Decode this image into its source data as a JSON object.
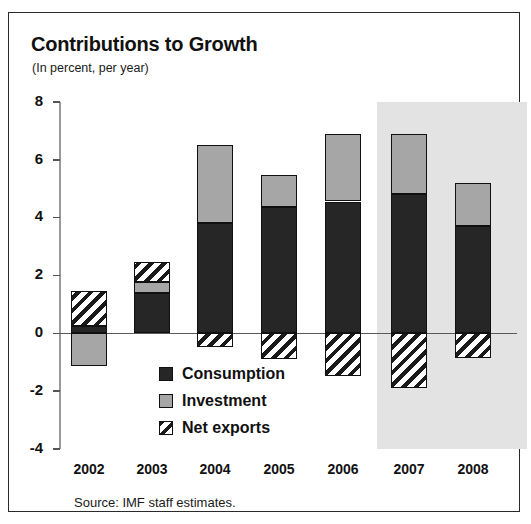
{
  "chart_data": {
    "type": "bar",
    "title": "Contributions to Growth",
    "subtitle": "(In percent, per year)",
    "xlabel": "",
    "ylabel": "",
    "ylim": [
      -4,
      8
    ],
    "yticks": [
      8,
      6,
      4,
      2,
      0,
      -2,
      -4
    ],
    "grid": false,
    "stacked": true,
    "legend_position": "inside-lower-center",
    "categories": [
      "2002",
      "2003",
      "2004",
      "2005",
      "2006",
      "2007",
      "2008"
    ],
    "series": [
      {
        "name": "Consumption",
        "color": "#262626",
        "values": [
          0.25,
          1.4,
          3.8,
          4.35,
          4.55,
          4.8,
          3.7
        ]
      },
      {
        "name": "Investment",
        "color": "#a6a6a6",
        "values": [
          -1.15,
          0.35,
          2.7,
          1.1,
          2.35,
          2.1,
          1.5
        ]
      },
      {
        "name": "Net exports",
        "color": "#ffffff",
        "hatch": "diagonal",
        "values": [
          1.2,
          0.7,
          -0.5,
          -0.9,
          -1.5,
          -1.9,
          -0.85
        ]
      }
    ],
    "segments": [
      {
        "category": "2002",
        "name": "Net exports",
        "from": 0.25,
        "to": 1.45
      },
      {
        "category": "2002",
        "name": "Consumption",
        "from": 0.0,
        "to": 0.25
      },
      {
        "category": "2002",
        "name": "Investment",
        "from": -1.15,
        "to": 0.0
      },
      {
        "category": "2003",
        "name": "Net exports",
        "from": 1.75,
        "to": 2.45
      },
      {
        "category": "2003",
        "name": "Investment",
        "from": 1.4,
        "to": 1.75
      },
      {
        "category": "2003",
        "name": "Consumption",
        "from": 0.0,
        "to": 1.4
      },
      {
        "category": "2004",
        "name": "Investment",
        "from": 3.8,
        "to": 6.5
      },
      {
        "category": "2004",
        "name": "Consumption",
        "from": 0.0,
        "to": 3.8
      },
      {
        "category": "2004",
        "name": "Net exports",
        "from": -0.5,
        "to": 0.0
      },
      {
        "category": "2005",
        "name": "Investment",
        "from": 4.35,
        "to": 5.45
      },
      {
        "category": "2005",
        "name": "Consumption",
        "from": 0.0,
        "to": 4.35
      },
      {
        "category": "2005",
        "name": "Net exports",
        "from": -0.9,
        "to": 0.0
      },
      {
        "category": "2006",
        "name": "Investment",
        "from": 4.55,
        "to": 6.9
      },
      {
        "category": "2006",
        "name": "Consumption",
        "from": 0.0,
        "to": 4.55
      },
      {
        "category": "2006",
        "name": "Net exports",
        "from": -1.5,
        "to": 0.0
      },
      {
        "category": "2007",
        "name": "Investment",
        "from": 4.8,
        "to": 6.9
      },
      {
        "category": "2007",
        "name": "Consumption",
        "from": 0.0,
        "to": 4.8
      },
      {
        "category": "2007",
        "name": "Net exports",
        "from": -1.9,
        "to": 0.0
      },
      {
        "category": "2008",
        "name": "Investment",
        "from": 3.7,
        "to": 5.2
      },
      {
        "category": "2008",
        "name": "Consumption",
        "from": 0.0,
        "to": 3.7
      },
      {
        "category": "2008",
        "name": "Net exports",
        "from": -0.85,
        "to": 0.0
      }
    ],
    "shaded_forecast": {
      "from_category": "2007",
      "to_category": "2008",
      "color": "#e3e3e3"
    },
    "legend": [
      {
        "label": "Consumption",
        "swatch": "solid-dark"
      },
      {
        "label": "Investment",
        "swatch": "solid-grey"
      },
      {
        "label": "Net exports",
        "swatch": "hatched"
      }
    ],
    "source_note": "Source: IMF staff estimates."
  }
}
